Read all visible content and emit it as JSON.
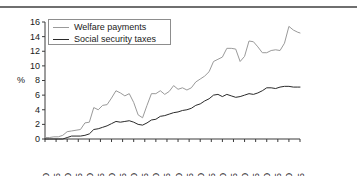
{
  "figure": {
    "title": "at factor cost 1900–2015",
    "axis_label_y": "%"
  },
  "legend": {
    "position": "top-left-inside",
    "entries": [
      {
        "label": "Welfare payments",
        "color": "#9a9a9a"
      },
      {
        "label": "Social security taxes",
        "color": "#2a2a2a"
      }
    ]
  },
  "chart_data": {
    "type": "line",
    "title": "at factor cost 1900–2015",
    "xlabel": "",
    "ylabel": "%",
    "xlim": [
      1900,
      2015
    ],
    "ylim": [
      0,
      16
    ],
    "yticks": [
      0,
      2,
      4,
      6,
      8,
      10,
      12,
      14,
      16
    ],
    "xticks": [
      1900,
      1905,
      1910,
      1915,
      1920,
      1925,
      1930,
      1935,
      1940,
      1945,
      1950,
      1955,
      1960,
      1965,
      1970,
      1975,
      1980,
      1985,
      1990,
      1995,
      2000,
      2005,
      2010,
      2015
    ],
    "grid": false,
    "legend_position": "upper left",
    "x": [
      1900,
      1902,
      1904,
      1906,
      1908,
      1910,
      1912,
      1914,
      1916,
      1918,
      1920,
      1922,
      1924,
      1926,
      1928,
      1930,
      1932,
      1934,
      1936,
      1938,
      1940,
      1942,
      1944,
      1946,
      1948,
      1950,
      1952,
      1954,
      1956,
      1958,
      1960,
      1962,
      1964,
      1966,
      1968,
      1970,
      1972,
      1974,
      1976,
      1978,
      1980,
      1982,
      1984,
      1986,
      1988,
      1990,
      1992,
      1994,
      1996,
      1998,
      2000,
      2002,
      2004,
      2006,
      2008,
      2010,
      2012,
      2014,
      2015
    ],
    "series": [
      {
        "name": "Welfare payments",
        "color": "#9a9a9a",
        "values": [
          0.2,
          0.2,
          0.3,
          0.3,
          0.5,
          1.0,
          1.1,
          1.2,
          1.3,
          2.2,
          2.3,
          4.3,
          4.0,
          4.6,
          4.7,
          5.6,
          6.6,
          6.3,
          5.9,
          6.2,
          5.0,
          3.3,
          2.9,
          4.6,
          6.2,
          6.2,
          6.6,
          6.1,
          6.5,
          7.3,
          6.8,
          7.0,
          6.7,
          7.0,
          7.8,
          8.2,
          8.6,
          9.2,
          10.6,
          10.9,
          11.2,
          12.4,
          12.4,
          12.3,
          10.6,
          11.3,
          13.4,
          13.3,
          12.6,
          11.8,
          11.8,
          12.1,
          12.2,
          12.1,
          13.1,
          15.4,
          14.9,
          14.6,
          14.5
        ]
      },
      {
        "name": "Social security taxes",
        "color": "#2a2a2a",
        "values": [
          0.0,
          0.0,
          0.0,
          0.0,
          0.0,
          0.2,
          0.4,
          0.4,
          0.4,
          0.5,
          0.7,
          1.3,
          1.4,
          1.6,
          1.8,
          2.1,
          2.4,
          2.3,
          2.4,
          2.5,
          2.3,
          2.0,
          1.9,
          2.2,
          2.6,
          2.7,
          3.1,
          3.2,
          3.4,
          3.6,
          3.7,
          3.9,
          4.0,
          4.2,
          4.6,
          4.8,
          5.2,
          5.5,
          6.0,
          6.1,
          5.8,
          6.1,
          5.9,
          5.7,
          5.8,
          6.0,
          6.2,
          6.1,
          6.3,
          6.6,
          7.0,
          7.0,
          6.9,
          7.1,
          7.2,
          7.2,
          7.1,
          7.1,
          7.1
        ]
      }
    ]
  }
}
